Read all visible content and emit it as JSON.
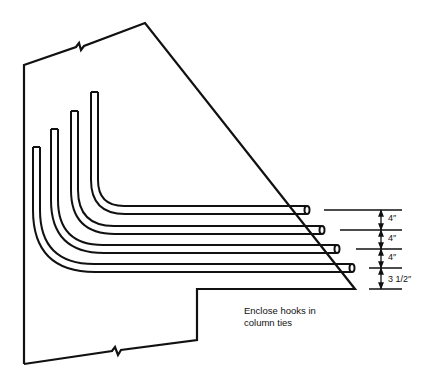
{
  "diagram": {
    "title": "",
    "note": {
      "line1": "Enclose hooks in",
      "line2": "column ties"
    },
    "dimensions": [
      {
        "label": "4″"
      },
      {
        "label": "4″"
      },
      {
        "label": "4″"
      },
      {
        "label": "3 1/2″"
      }
    ],
    "bars_count": 4,
    "colors": {
      "line": "#111111",
      "background": "#ffffff"
    }
  }
}
